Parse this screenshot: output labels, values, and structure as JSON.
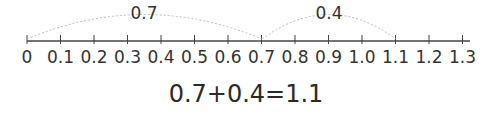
{
  "number_line": {
    "ticks": [
      "0",
      "0.1",
      "0.2",
      "0.3",
      "0.4",
      "0.5",
      "0.6",
      "0.7",
      "0.8",
      "0.9",
      "1.0",
      "1.1",
      "1.2",
      "1.3"
    ],
    "jumps": [
      {
        "from": 0,
        "to": 0.7,
        "label": "0.7"
      },
      {
        "from": 0.7,
        "to": 1.1,
        "label": "0.4"
      }
    ]
  },
  "equation": "0.7+0.4=1.1"
}
